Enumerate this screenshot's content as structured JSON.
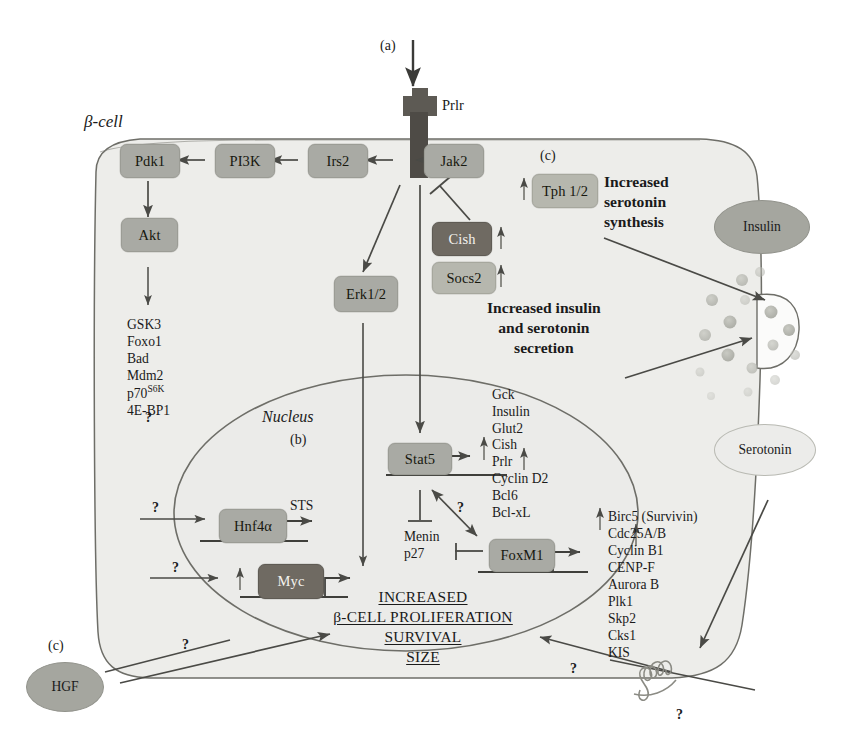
{
  "figure": {
    "type": "signaling-pathway-diagram",
    "cell_label": "β-cell",
    "nucleus_label": "Nucleus",
    "panel_markers": {
      "a": "(a)",
      "b": "(b)",
      "c_top": "(c)",
      "c_bottom": "(c)"
    },
    "receptor_label": "Prlr",
    "question_marks": [
      "?",
      "?",
      "?",
      "?",
      "?",
      "?",
      "?",
      "?"
    ]
  },
  "nodes": {
    "jak2": "Jak2",
    "irs2": "Irs2",
    "pi3k": "PI3K",
    "pdk1": "Pdk1",
    "akt": "Akt",
    "erk": "Erk1/2",
    "cish": "Cish",
    "socs2": "Socs2",
    "tph": "Tph 1/2",
    "stat5": "Stat5",
    "foxm1": "FoxM1",
    "hnf4a": "Hnf4α",
    "myc": "Myc",
    "hgf": "HGF",
    "insulin": "Insulin",
    "serotonin": "Serotonin"
  },
  "akt_targets": {
    "items": [
      "GSK3",
      "Foxo1",
      "Bad",
      "Mdm2",
      "p70",
      "4E-BP1"
    ],
    "p70_superscript": "S6K",
    "text": "GSK3\nFoxo1\nBad\nMdm2\np70\n4E-BP1"
  },
  "stat5_targets": {
    "group_a": [
      "Gck",
      "Insulin",
      "Glut2"
    ],
    "group_b": [
      "Cish",
      "Prlr",
      "Cyclin D2",
      "Bcl6",
      "Bcl-xL"
    ]
  },
  "foxm1_targets": [
    "Birc5 (Survivin)",
    "Cdc25A/B",
    "Cyclin B1",
    "CENP-F",
    "Aurora B",
    "Plk1",
    "Skp2",
    "Cks1",
    "KIS"
  ],
  "inhibitors": {
    "menin": "Menin",
    "p27": "p27"
  },
  "hnf4a_target": "STS",
  "annotations": {
    "serotonin_synthesis": "Increased\nserotonin\nsynthesis",
    "serotonin_synthesis_lines": [
      "Increased",
      "serotonin",
      "synthesis"
    ],
    "secretion": "Increased insulin\nand serotonin\nsecretion",
    "secretion_lines": [
      "Increased insulin",
      "and serotonin",
      "secretion"
    ],
    "outcome_lines": [
      "INCREASED",
      "β-CELL PROLIFERATION",
      "SURVIVAL",
      "SIZE"
    ]
  },
  "colors": {
    "cell_fill": "#ededea",
    "nucleus_fill": "#ececeb",
    "box_fill": "#a9aaa4",
    "box_dark": "#6f6a62",
    "receptor_fill": "#5d5a54",
    "stroke": "#6e6e68",
    "text": "#1a1a1a"
  }
}
